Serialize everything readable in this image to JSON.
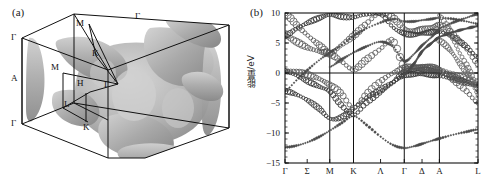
{
  "figure": {
    "panels": [
      {
        "tag": "(a)",
        "kind": "brillouin-zone-fermi-surface"
      },
      {
        "tag": "(b)",
        "kind": "band-structure"
      }
    ]
  },
  "panel_a": {
    "tag": "(a)",
    "description": "Fermi surface inside hexagonal Brillouin zone prism",
    "symmetry_labels": [
      {
        "text": "Γ",
        "x": 11,
        "y": 36
      },
      {
        "text": "Γ",
        "x": 137,
        "y": 18
      },
      {
        "text": "Γ",
        "x": 11,
        "y": 122
      },
      {
        "text": "Γ",
        "x": 104,
        "y": 86
      },
      {
        "text": "A",
        "x": 11,
        "y": 78
      },
      {
        "text": "M",
        "x": 76,
        "y": 25
      },
      {
        "text": "M",
        "x": 51,
        "y": 67
      },
      {
        "text": "K",
        "x": 93,
        "y": 53
      },
      {
        "text": "K",
        "x": 86,
        "y": 126
      },
      {
        "text": "H",
        "x": 78,
        "y": 83
      },
      {
        "text": "L",
        "x": 65,
        "y": 104
      }
    ]
  },
  "panel_b": {
    "tag": "(b)",
    "chart_data": {
      "type": "line",
      "title": "",
      "xlabel": "",
      "ylabel": "能量/eV",
      "ylim": [
        -15,
        10
      ],
      "yticks": [
        10,
        5,
        0,
        -5,
        -10,
        -15
      ],
      "ytick_labels": [
        "10",
        "5",
        "0",
        "−5",
        "−10",
        "−15"
      ],
      "grid": true,
      "grid_vertical_at": [
        "M",
        "K",
        "Γ",
        "A"
      ],
      "fermi_level": 0,
      "legend": "none",
      "xticks": [
        {
          "label": "Γ",
          "pos": 0.0
        },
        {
          "label": "Σ",
          "pos": 0.115
        },
        {
          "label": "M",
          "pos": 0.232
        },
        {
          "label": "K",
          "pos": 0.355
        },
        {
          "label": "Λ",
          "pos": 0.495
        },
        {
          "label": "Γ",
          "pos": 0.618
        },
        {
          "label": "Δ",
          "pos": 0.71
        },
        {
          "label": "A",
          "pos": 0.8
        },
        {
          "label": "L",
          "pos": 1.0
        }
      ],
      "x_symmetry_points": [
        0.0,
        0.232,
        0.355,
        0.618,
        0.8,
        1.0
      ],
      "marker": "open-circle",
      "marker_note": "circle size encodes orbital weight (fat bands)",
      "series": [
        {
          "name": "band-1",
          "style": "dotted-small",
          "x": [
            0.0,
            0.06,
            0.12,
            0.18,
            0.232,
            0.29,
            0.355,
            0.42,
            0.495,
            0.56,
            0.618,
            0.67,
            0.71,
            0.76,
            0.8,
            0.87,
            0.94,
            1.0
          ],
          "y": [
            -12.4,
            -12.1,
            -11.5,
            -10.6,
            -9.6,
            -8.4,
            -7.2,
            -8.6,
            -10.6,
            -12.0,
            -12.5,
            -12.2,
            -11.8,
            -11.3,
            -10.9,
            -10.3,
            -9.8,
            -9.4
          ]
        },
        {
          "name": "band-2",
          "style": "heavy-circle",
          "x": [
            0.0,
            0.06,
            0.12,
            0.18,
            0.232,
            0.29,
            0.355,
            0.42,
            0.495,
            0.56,
            0.618,
            0.67,
            0.71,
            0.76,
            0.8,
            0.87,
            0.94,
            1.0
          ],
          "y": [
            -3.0,
            -3.6,
            -4.6,
            -6.0,
            -7.6,
            -7.4,
            -5.9,
            -4.2,
            -2.8,
            -1.5,
            -0.4,
            -0.2,
            -0.2,
            -0.3,
            -0.5,
            -1.0,
            -1.6,
            -2.2
          ]
        },
        {
          "name": "band-3",
          "style": "heavy-circle",
          "x": [
            0.0,
            0.06,
            0.12,
            0.18,
            0.232,
            0.29,
            0.355,
            0.42,
            0.495,
            0.56,
            0.618,
            0.67,
            0.71,
            0.76,
            0.8,
            0.87,
            0.94,
            1.0
          ],
          "y": [
            0.3,
            -0.4,
            -1.4,
            -2.3,
            -3.1,
            -5.3,
            -7.0,
            -5.0,
            -3.2,
            -1.6,
            0.2,
            0.5,
            0.6,
            0.4,
            0.2,
            -0.6,
            -1.4,
            -2.0
          ]
        },
        {
          "name": "band-4",
          "style": "open-circle",
          "x": [
            0.0,
            0.06,
            0.12,
            0.18,
            0.232,
            0.29,
            0.355,
            0.42,
            0.495,
            0.56,
            0.618,
            0.67,
            0.71,
            0.76,
            0.8,
            0.87,
            0.94,
            1.0
          ],
          "y": [
            0.4,
            0.2,
            -0.3,
            -1.0,
            -2.0,
            -3.4,
            -5.8,
            -3.6,
            -1.4,
            0.0,
            0.8,
            1.0,
            1.0,
            0.9,
            0.6,
            -0.2,
            -1.0,
            -1.8
          ]
        },
        {
          "name": "band-5",
          "style": "open-circle",
          "x": [
            0.0,
            0.06,
            0.12,
            0.18,
            0.232,
            0.29,
            0.355,
            0.42,
            0.495,
            0.56,
            0.618,
            0.67,
            0.71,
            0.76,
            0.8,
            0.87,
            0.94,
            1.0
          ],
          "y": [
            6.2,
            5.2,
            4.2,
            3.6,
            3.2,
            2.0,
            0.6,
            2.2,
            4.0,
            5.4,
            1.0,
            1.0,
            0.9,
            0.7,
            0.5,
            -1.0,
            -3.0,
            -5.0
          ]
        },
        {
          "name": "band-6",
          "style": "open-circle",
          "x": [
            0.0,
            0.06,
            0.12,
            0.18,
            0.232,
            0.29,
            0.355,
            0.42,
            0.495,
            0.56,
            0.618,
            0.67,
            0.71,
            0.76,
            0.8,
            0.87,
            0.94,
            1.0
          ],
          "y": [
            10.0,
            8.0,
            6.2,
            4.6,
            3.3,
            4.6,
            6.2,
            8.2,
            10.0,
            9.2,
            7.4,
            7.0,
            7.2,
            7.6,
            8.0,
            6.4,
            4.0,
            1.6
          ]
        },
        {
          "name": "band-7",
          "style": "heavy-circle",
          "x": [
            0.0,
            0.06,
            0.12,
            0.18,
            0.232,
            0.29,
            0.355,
            0.42,
            0.495,
            0.56,
            0.618,
            0.67,
            0.71,
            0.76,
            0.8,
            0.87,
            0.94,
            1.0
          ],
          "y": [
            6.2,
            7.4,
            8.4,
            9.2,
            9.7,
            9.4,
            9.3,
            9.8,
            10.0,
            7.6,
            6.6,
            6.4,
            6.6,
            6.8,
            6.9,
            6.0,
            4.4,
            2.6
          ]
        },
        {
          "name": "band-8",
          "style": "dotted-small",
          "x": [
            0.0,
            0.06,
            0.12,
            0.18,
            0.232,
            0.29,
            0.355,
            0.42,
            0.495,
            0.56,
            0.618,
            0.67,
            0.71,
            0.76,
            0.8,
            0.87,
            0.94,
            1.0
          ],
          "y": [
            -3.0,
            -1.2,
            0.6,
            2.2,
            3.4,
            4.6,
            6.2,
            7.4,
            8.4,
            9.0,
            8.6,
            8.6,
            8.8,
            9.0,
            9.2,
            9.0,
            8.6,
            8.2
          ]
        },
        {
          "name": "band-9",
          "style": "dotted-small",
          "x": [
            0.232,
            0.29,
            0.355,
            0.42,
            0.495,
            0.56,
            0.618,
            0.67,
            0.71,
            0.76,
            0.8,
            0.87,
            0.94,
            1.0
          ],
          "y": [
            1.0,
            2.2,
            3.4,
            4.4,
            5.2,
            4.4,
            2.0,
            3.2,
            4.6,
            6.0,
            7.4,
            8.4,
            9.2,
            9.8
          ]
        },
        {
          "name": "band-10",
          "style": "sparse-circle",
          "x": [
            0.8,
            0.84,
            0.87,
            0.9,
            0.94,
            0.97,
            1.0
          ],
          "y": [
            9.6,
            7.8,
            5.8,
            3.6,
            1.4,
            -0.8,
            -3.0
          ]
        },
        {
          "name": "band-11",
          "style": "sparse-circle",
          "x": [
            0.8,
            0.84,
            0.87,
            0.9,
            0.94,
            0.97,
            1.0
          ],
          "y": [
            5.4,
            4.4,
            3.2,
            1.8,
            0.2,
            -1.6,
            -3.6
          ]
        },
        {
          "name": "band-12",
          "style": "dotted-small",
          "x": [
            0.618,
            0.67,
            0.71,
            0.76,
            0.8,
            0.87,
            0.94,
            1.0
          ],
          "y": [
            -0.2,
            1.6,
            3.6,
            5.0,
            6.0,
            6.8,
            7.4,
            7.8
          ]
        }
      ]
    }
  }
}
